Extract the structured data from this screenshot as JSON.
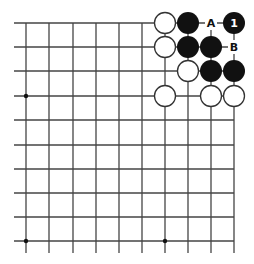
{
  "diagram": {
    "type": "go-board-fragment",
    "grid": {
      "columns": 10,
      "rows": 10,
      "col_x": [
        26,
        49,
        73,
        96,
        119,
        142,
        165,
        188,
        211,
        234
      ],
      "row_y": [
        23,
        47,
        71,
        96,
        120,
        145,
        169,
        193,
        217,
        241
      ],
      "left_extend_to": 14,
      "bottom_extend_to": 253,
      "top_edge": true,
      "right_edge": true,
      "line_color": "#444444"
    },
    "star_points": [
      {
        "col": 0,
        "row": 3
      },
      {
        "col": 0,
        "row": 9
      },
      {
        "col": 6,
        "row": 9
      }
    ],
    "stones": [
      {
        "color": "white",
        "col": 6,
        "row": 0
      },
      {
        "color": "black",
        "col": 7,
        "row": 0
      },
      {
        "color": "black",
        "col": 9,
        "row": 0,
        "label": "1"
      },
      {
        "color": "white",
        "col": 6,
        "row": 1
      },
      {
        "color": "black",
        "col": 7,
        "row": 1
      },
      {
        "color": "black",
        "col": 8,
        "row": 1
      },
      {
        "color": "white",
        "col": 7,
        "row": 2
      },
      {
        "color": "black",
        "col": 8,
        "row": 2
      },
      {
        "color": "black",
        "col": 9,
        "row": 2
      },
      {
        "color": "white",
        "col": 6,
        "row": 3
      },
      {
        "color": "white",
        "col": 8,
        "row": 3
      },
      {
        "color": "white",
        "col": 9,
        "row": 3
      }
    ],
    "point_labels": [
      {
        "text": "A",
        "col": 8,
        "row": 0
      },
      {
        "text": "B",
        "col": 9,
        "row": 1
      }
    ],
    "colors": {
      "black_stone": "#111111",
      "white_stone_fill": "#ffffff",
      "white_stone_stroke": "#333333",
      "stone_label": "#ffffff",
      "point_label": "#111111"
    }
  }
}
